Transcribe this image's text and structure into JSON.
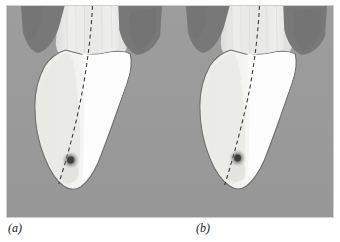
{
  "figure": {
    "name": "two-panel-grayscale-anatomical-figure",
    "width": 340,
    "height": 242,
    "frame_border_color": "#cfcfcf",
    "background_color": "#ffffff"
  },
  "colors": {
    "panel_background_gray": "#9a9a9a",
    "dark_wedge_gray": "#787878",
    "mid_gray": "#8d8d8d",
    "light_cream": "#eeeeec",
    "pale_band": "#e4e4e2",
    "bright_white": "#fdfdfd",
    "dashed_line": "#3a3a3a",
    "dot_core": "#3c3c3c",
    "outline": "#6f6f6f",
    "caption_text": "#1a1a1a"
  },
  "panels": [
    {
      "id": "panel-a",
      "caption": "(a)",
      "features": {
        "background_label": "surrounding-tissue",
        "left_wedge_label": "left-dark-wedge",
        "right_wedge_label": "right-dark-wedge",
        "body_label": "central-white-body",
        "pale_region_label": "pale-left-lobe",
        "dashed_axis_label": "dashed-center-axis",
        "marker_label": "dark-focal-spot"
      },
      "marker": {
        "x_pct": 38,
        "y_pct": 73,
        "radius_px": 7
      }
    },
    {
      "id": "panel-b",
      "caption": "(b)",
      "features": {
        "background_label": "surrounding-tissue",
        "left_wedge_label": "left-dark-wedge",
        "right_wedge_label": "right-dark-wedge",
        "body_label": "central-white-body",
        "pale_region_label": "pale-left-lobe",
        "dashed_axis_label": "dashed-center-axis",
        "marker_label": "dark-focal-spot"
      },
      "marker": {
        "x_pct": 40,
        "y_pct": 72,
        "radius_px": 7
      }
    }
  ],
  "captions": {
    "a": "(a)",
    "b": "(b)"
  }
}
